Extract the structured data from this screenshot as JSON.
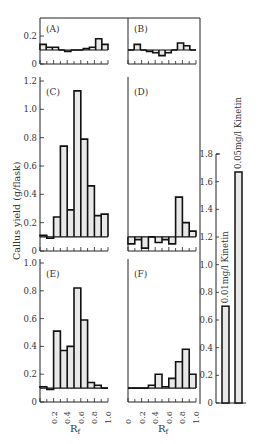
{
  "chart_data": {
    "type": "bar",
    "ylabel": "Callus yield (g/flask)",
    "xlabel": "Rf",
    "baseline": 0.1,
    "fill_color": "#e8e8e8",
    "line_color": "#111111",
    "x_ticks": [
      "0",
      "0.2",
      "0.4",
      "0.6",
      "0.8",
      "1.0"
    ],
    "panels": [
      {
        "id": "A",
        "label": "(A)",
        "ylim": [
          0,
          0.3
        ],
        "yticks": [
          "0",
          "0.2"
        ],
        "bins": [
          0,
          0.1,
          0.2,
          0.3,
          0.4,
          0.5,
          0.6,
          0.7,
          0.8,
          0.9,
          1.0
        ],
        "values": [
          0.14,
          0.12,
          0.12,
          0.1,
          0.09,
          0.1,
          0.1,
          0.11,
          0.12,
          0.18,
          0.14
        ]
      },
      {
        "id": "B",
        "label": "(B)",
        "ylim": [
          0,
          0.3
        ],
        "yticks": [],
        "bins": [
          0,
          0.1,
          0.2,
          0.3,
          0.4,
          0.5,
          0.6,
          0.7,
          0.8,
          0.9,
          1.0
        ],
        "values": [
          0.1,
          0.14,
          0.1,
          0.09,
          0.08,
          0.06,
          0.08,
          0.1,
          0.15,
          0.13,
          0.1
        ]
      },
      {
        "id": "C",
        "label": "(C)",
        "ylim": [
          0,
          1.2
        ],
        "yticks": [
          "0",
          "0.2",
          "0.4",
          "0.6",
          "0.8",
          "1.0",
          "1.2"
        ],
        "bins": [
          0,
          0.1,
          0.2,
          0.3,
          0.4,
          0.5,
          0.6,
          0.7,
          0.8,
          0.9,
          1.0
        ],
        "values": [
          0.11,
          0.09,
          0.24,
          0.74,
          0.29,
          1.13,
          0.79,
          0.46,
          0.25,
          0.26
        ]
      },
      {
        "id": "D",
        "label": "(D)",
        "ylim": [
          0,
          1.2
        ],
        "yticks": [],
        "bins": [
          0,
          0.1,
          0.2,
          0.3,
          0.4,
          0.5,
          0.6,
          0.7,
          0.8,
          0.9,
          1.0
        ],
        "values": [
          0.05,
          0.08,
          0.02,
          0.1,
          0.06,
          0.08,
          0.05,
          0.38,
          0.2,
          0.14
        ]
      },
      {
        "id": "E",
        "label": "(E)",
        "ylim": [
          0,
          1.0
        ],
        "yticks": [
          "0",
          "0.2",
          "0.4",
          "0.6",
          "0.8",
          "1.0"
        ],
        "bins": [
          0,
          0.1,
          0.2,
          0.3,
          0.4,
          0.5,
          0.6,
          0.7,
          0.8,
          0.9,
          1.0
        ],
        "values": [
          0.11,
          0.09,
          0.51,
          0.37,
          0.4,
          0.82,
          0.59,
          0.14,
          0.12,
          0.1
        ]
      },
      {
        "id": "F",
        "label": "(F)",
        "ylim": [
          0,
          1.0
        ],
        "yticks": [],
        "bins": [
          0,
          0.1,
          0.2,
          0.3,
          0.4,
          0.5,
          0.6,
          0.7,
          0.8,
          0.9,
          1.0
        ],
        "values": [
          0.1,
          0.1,
          0.1,
          0.12,
          0.2,
          0.11,
          0.17,
          0.29,
          0.38,
          0.2
        ]
      }
    ],
    "summary_bars": {
      "ylim": [
        0,
        1.8
      ],
      "yticks": [
        "0",
        "0.2",
        "0.4",
        "0.6",
        "0.8",
        "1.0",
        "1.2",
        "1.4",
        "1.6",
        "1.8"
      ],
      "categories": [
        "0.01mg/l Kinetin",
        "0.05mg/l Kinetin"
      ],
      "values": [
        0.7,
        1.67
      ]
    }
  }
}
